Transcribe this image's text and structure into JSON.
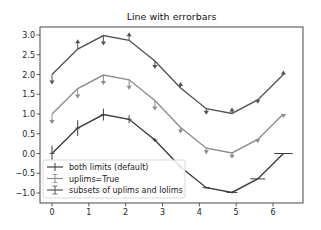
{
  "chart_data": {
    "type": "line",
    "title": "Line with errorbars",
    "xlabel": "",
    "ylabel": "",
    "xlim": [
      -0.31,
      6.6
    ],
    "ylim": [
      -1.25,
      3.2
    ],
    "xticks": [
      0,
      1,
      2,
      3,
      4,
      5,
      6
    ],
    "xtick_labels": [
      "0",
      "1",
      "2",
      "3",
      "4",
      "5",
      "6"
    ],
    "yticks": [
      -1.0,
      -0.5,
      0.0,
      0.5,
      1.0,
      1.5,
      2.0,
      2.5,
      3.0
    ],
    "ytick_labels": [
      "−1.0",
      "−0.5",
      "0.0",
      "0.5",
      "1.0",
      "1.5",
      "2.0",
      "2.5",
      "3.0"
    ],
    "grid": false,
    "legend_position": "lower-left",
    "x": [
      0.0,
      0.698,
      1.396,
      2.094,
      2.793,
      3.491,
      4.189,
      4.887,
      5.585,
      6.283
    ],
    "series": [
      {
        "name": "both limits (default)",
        "color": "#3c3c3c",
        "values": [
          0.0,
          0.643,
          0.985,
          0.866,
          0.342,
          -0.342,
          -0.866,
          -0.985,
          -0.643,
          0.0
        ],
        "yerr": [
          0.2,
          0.2,
          0.15,
          0.1,
          0.05,
          0.05,
          0.02,
          0.02,
          0.0,
          0.0
        ],
        "xerr": [
          0.0,
          0.0,
          0.0,
          0.0,
          0.0,
          0.0,
          0.1,
          0.15,
          0.2,
          0.25
        ],
        "limits": [
          "both",
          "both",
          "both",
          "both",
          "both",
          "both",
          "both",
          "both",
          "both",
          "both"
        ]
      },
      {
        "name": "uplims=True",
        "color": "#8c8c8c",
        "values": [
          1.0,
          1.643,
          1.985,
          1.866,
          1.342,
          0.658,
          0.134,
          0.015,
          0.357,
          1.0
        ],
        "yerr": [
          0.2,
          0.2,
          0.2,
          0.2,
          0.2,
          0.1,
          0.1,
          0.1,
          0.05,
          0.05
        ],
        "limits": [
          "up",
          "up",
          "up",
          "up",
          "up",
          "up",
          "up",
          "up",
          "up",
          "up"
        ]
      },
      {
        "name": "subsets of uplims and lolims",
        "color": "#555555",
        "values": [
          2.0,
          2.643,
          2.985,
          2.866,
          2.342,
          1.658,
          1.134,
          1.015,
          1.357,
          2.0
        ],
        "yerr": [
          0.2,
          0.2,
          0.2,
          0.15,
          0.15,
          0.1,
          0.1,
          0.1,
          0.05,
          0.05
        ],
        "limits": [
          "up",
          "lo",
          "up",
          "lo",
          "up",
          "lo",
          "up",
          "lo",
          "up",
          "lo"
        ]
      }
    ]
  }
}
